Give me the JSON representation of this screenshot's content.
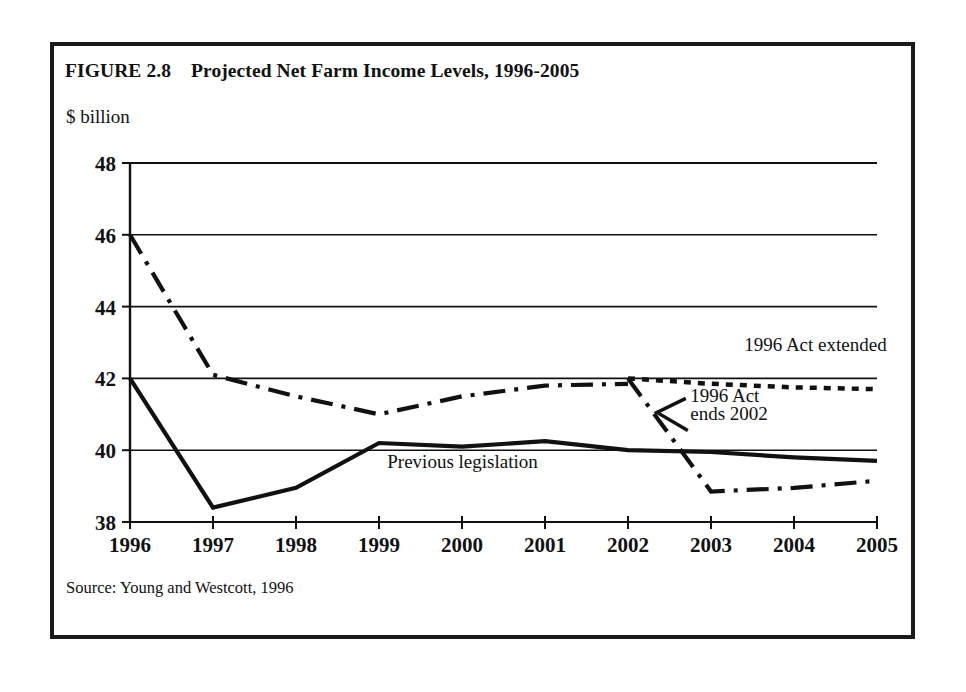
{
  "figure": {
    "title": "FIGURE 2.8    Projected Net Farm Income Levels, 1996-2005",
    "unit_label": "$ billion",
    "source": "Source: Young and Westcott, 1996"
  },
  "chart_data": {
    "type": "line",
    "title": "Projected Net Farm Income Levels, 1996-2005",
    "xlabel": "",
    "ylabel": "$ billion",
    "x": [
      1996,
      1997,
      1998,
      1999,
      2000,
      2001,
      2002,
      2003,
      2004,
      2005
    ],
    "categories": [
      "1996",
      "1997",
      "1998",
      "1999",
      "2000",
      "2001",
      "2002",
      "2003",
      "2004",
      "2005"
    ],
    "xlim": [
      1996,
      2005
    ],
    "ylim": [
      38,
      48
    ],
    "yticks": [
      38,
      40,
      42,
      44,
      46,
      48
    ],
    "ytick_labels": [
      "38",
      "40",
      "42",
      "44",
      "46",
      "48"
    ],
    "grid": "horizontal",
    "legend": "inline-annotations",
    "series": [
      {
        "name": "1996 Act extended",
        "style": "dash-dot-then-dotted",
        "annotation": "1996 Act extended",
        "x": [
          1996,
          1997,
          1998,
          1999,
          2000,
          2001,
          2002,
          2003,
          2004,
          2005
        ],
        "values": [
          46.0,
          42.1,
          41.5,
          41.0,
          41.5,
          41.8,
          41.8,
          41.9,
          42.0,
          41.7
        ],
        "segments": [
          {
            "style": "dash-dot",
            "x": [
              1996,
              1997,
              1998,
              1999,
              2000,
              2001,
              2002
            ],
            "values": [
              46.0,
              42.1,
              41.5,
              41.0,
              41.5,
              41.8,
              41.85,
              42.0
            ]
          },
          {
            "style": "dotted",
            "x": [
              2002,
              2003,
              2004,
              2005
            ],
            "values": [
              42.0,
              41.85,
              41.75,
              41.7
            ]
          }
        ]
      },
      {
        "name": "1996 Act ends 2002",
        "style": "dash-dot",
        "annotation": "1996 Act ends 2002",
        "x": [
          2002,
          2003,
          2004,
          2005
        ],
        "values": [
          42.0,
          38.85,
          38.95,
          39.15
        ]
      },
      {
        "name": "Previous legislation",
        "style": "solid",
        "annotation": "Previous legislation",
        "x": [
          1996,
          1997,
          1998,
          1999,
          2000,
          2001,
          2002,
          2003,
          2004,
          2005
        ],
        "values": [
          42.0,
          38.4,
          38.95,
          40.2,
          40.1,
          40.25,
          40.0,
          39.95,
          39.8,
          39.7
        ]
      }
    ],
    "annotations": [
      {
        "text": "1996 Act extended",
        "x": 2003.4,
        "y": 42.75
      },
      {
        "text": "1996 Act",
        "x": 2002.75,
        "y": 41.35
      },
      {
        "text": "ends 2002",
        "x": 2002.75,
        "y": 40.85
      },
      {
        "text": "Previous legislation",
        "x": 1999.1,
        "y": 39.5
      }
    ],
    "colors": {
      "line": "#111111",
      "grid": "#111111",
      "axis": "#111111",
      "background": "#ffffff"
    }
  }
}
